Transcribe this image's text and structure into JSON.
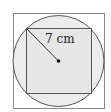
{
  "diagram": {
    "label": "7 cm",
    "shapes": [
      "outer-square",
      "circle",
      "inner-square",
      "radius-line",
      "center-point"
    ],
    "colors": {
      "stroke": "#555555",
      "circle_fill": "#ececec",
      "inner_fill": "#e4e4e4"
    }
  }
}
